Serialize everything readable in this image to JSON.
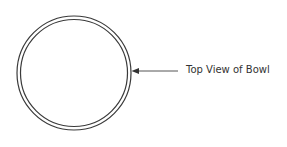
{
  "diagram": {
    "label": "Top View of Bowl",
    "stroke_color": "#3a3a3a",
    "text_color": "#333333"
  }
}
